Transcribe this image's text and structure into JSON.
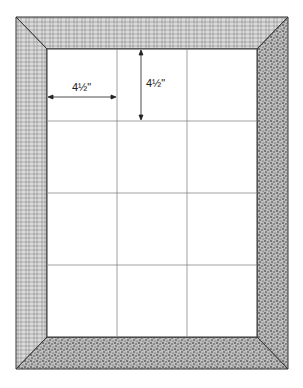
{
  "diagram": {
    "dimensions": {
      "horizontal_label": "4½\"",
      "vertical_label": "4½\""
    },
    "grid": {
      "columns": 3,
      "rows": 4
    },
    "border": {
      "top_pattern": "crosshatch",
      "left_pattern": "crosshatch",
      "right_pattern": "stipple",
      "bottom_pattern": "stipple"
    },
    "colors": {
      "line": "#444444",
      "grid_line": "#888888",
      "crosshatch_bg": "#d8d8d8",
      "stipple_bg": "#9a9a9a"
    }
  }
}
